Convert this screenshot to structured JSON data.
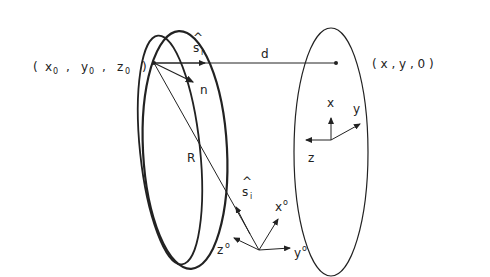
{
  "diagram": {
    "labels": {
      "source_point": "( x",
      "source_point_parts": [
        "x",
        "y",
        "z"
      ],
      "source_subscript": "0",
      "target_point": "( x , y , 0 )",
      "distance": "d",
      "normal": "n",
      "radius": "R",
      "s_r": "s",
      "s_r_sub": "r",
      "s_i": "s",
      "s_i_sub": "i",
      "hat": "^",
      "axis_x": "x",
      "axis_y": "y",
      "axis_z": "z",
      "axis_x0": "x",
      "axis_y0": "y",
      "axis_z0": "z",
      "superscript": "o",
      "comma": ",",
      "open_paren": "(",
      "close_paren": ")"
    },
    "colors": {
      "line": "#222222",
      "background": "#ffffff"
    }
  }
}
